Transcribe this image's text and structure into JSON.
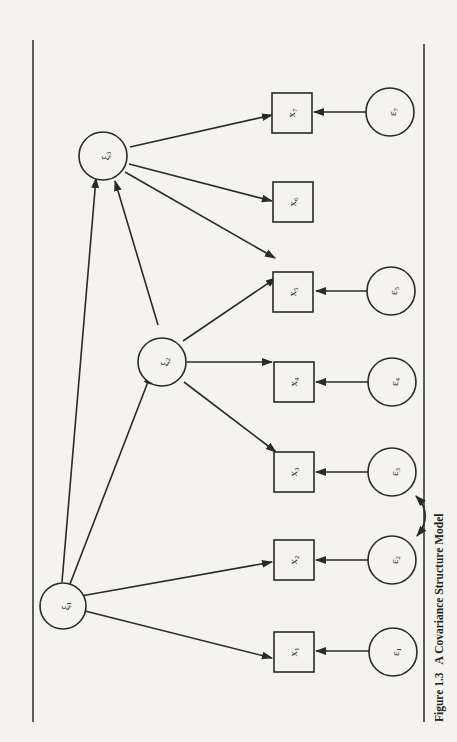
{
  "figure": {
    "caption_number": "Figure 1.3",
    "caption_title": "A Covariance Structure Model",
    "orientation": "rotated 90° counter-clockwise (landscape figure on portrait page)"
  },
  "latent_factors": [
    {
      "id": "xi1",
      "symbol": "ξ",
      "subscript": "1"
    },
    {
      "id": "xi2",
      "symbol": "ξ",
      "subscript": "2"
    },
    {
      "id": "xi3",
      "symbol": "ξ",
      "subscript": "3"
    }
  ],
  "observed": [
    {
      "id": "x1",
      "symbol": "x",
      "subscript": "1"
    },
    {
      "id": "x2",
      "symbol": "x",
      "subscript": "2"
    },
    {
      "id": "x3",
      "symbol": "x",
      "subscript": "3"
    },
    {
      "id": "x4",
      "symbol": "x",
      "subscript": "4"
    },
    {
      "id": "x5",
      "symbol": "x",
      "subscript": "5"
    },
    {
      "id": "x6",
      "symbol": "x",
      "subscript": "6"
    },
    {
      "id": "x7",
      "symbol": "x",
      "subscript": "7"
    }
  ],
  "errors": [
    {
      "id": "e1",
      "symbol": "ε",
      "subscript": "1"
    },
    {
      "id": "e2",
      "symbol": "ε",
      "subscript": "2"
    },
    {
      "id": "e3",
      "symbol": "ε",
      "subscript": "3"
    },
    {
      "id": "e4",
      "symbol": "ε",
      "subscript": "4"
    },
    {
      "id": "e5",
      "symbol": "ε",
      "subscript": "5"
    },
    {
      "id": "e7",
      "symbol": "ε",
      "subscript": "7"
    }
  ],
  "edges": [
    {
      "from": "xi1",
      "to": "x1",
      "type": "directed"
    },
    {
      "from": "xi1",
      "to": "x2",
      "type": "directed"
    },
    {
      "from": "xi1",
      "to": "xi2",
      "type": "directed"
    },
    {
      "from": "xi1",
      "to": "xi3",
      "type": "directed"
    },
    {
      "from": "xi2",
      "to": "x3",
      "type": "directed"
    },
    {
      "from": "xi2",
      "to": "x4",
      "type": "directed"
    },
    {
      "from": "xi2",
      "to": "x5",
      "type": "directed"
    },
    {
      "from": "xi2",
      "to": "xi3",
      "type": "directed"
    },
    {
      "from": "xi3",
      "to": "x5",
      "type": "directed"
    },
    {
      "from": "xi3",
      "to": "x6",
      "type": "directed"
    },
    {
      "from": "xi3",
      "to": "x7",
      "type": "directed"
    },
    {
      "from": "e1",
      "to": "x1",
      "type": "directed"
    },
    {
      "from": "e2",
      "to": "x2",
      "type": "directed"
    },
    {
      "from": "e3",
      "to": "x3",
      "type": "directed"
    },
    {
      "from": "e4",
      "to": "x4",
      "type": "directed"
    },
    {
      "from": "e5",
      "to": "x5",
      "type": "directed"
    },
    {
      "from": "e7",
      "to": "x7",
      "type": "directed"
    },
    {
      "from": "e2",
      "to": "e3",
      "type": "covariance"
    }
  ]
}
